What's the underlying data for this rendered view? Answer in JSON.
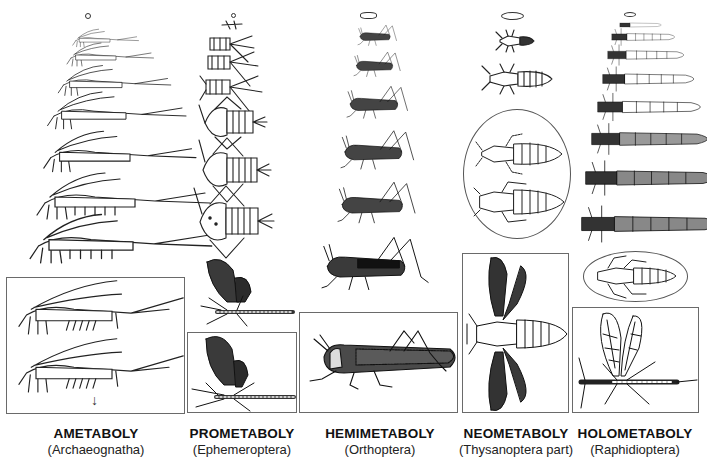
{
  "figure": {
    "columns": [
      {
        "id": "ametaboly",
        "title": "AMETABOLY",
        "taxon": "(Archaeognatha)",
        "stages": [
          "egg",
          "instar-1",
          "instar-2",
          "instar-3",
          "instar-4",
          "instar-5",
          "instar-6",
          "instar-7",
          "adult",
          "adult-molting"
        ],
        "framed_stages": 2,
        "arrow": "↓"
      },
      {
        "id": "prometaboly",
        "title": "PROMETABOLY",
        "taxon": "(Ephemeroptera)",
        "stages": [
          "egg",
          "nymph-1",
          "nymph-2",
          "nymph-3",
          "nymph-4",
          "nymph-5",
          "nymph-6",
          "nymph-7",
          "subimago",
          "imago"
        ],
        "framed_stages": 1
      },
      {
        "id": "hemimetaboly",
        "title": "HEMIMETABOLY",
        "taxon": "(Orthoptera)",
        "stages": [
          "egg",
          "nymph-1",
          "nymph-2",
          "nymph-3",
          "nymph-4",
          "nymph-5",
          "nymph-6",
          "adult"
        ],
        "framed_stages": 1
      },
      {
        "id": "neometaboly",
        "title": "NEOMETABOLY",
        "taxon": "(Thysanoptera part)",
        "stages": [
          "egg",
          "larva-1",
          "larva-2",
          "propupa",
          "pupa",
          "adult"
        ],
        "circled_stages": 2,
        "framed_stages": 1
      },
      {
        "id": "holometaboly",
        "title": "HOLOMETABOLY",
        "taxon": "(Raphidioptera)",
        "stages": [
          "egg",
          "larva-1",
          "larva-2",
          "larva-3",
          "larva-4",
          "larva-5",
          "larva-6",
          "larva-7",
          "larva-8",
          "pupa",
          "adult"
        ],
        "circled_stages": 1,
        "framed_stages": 1
      }
    ]
  }
}
